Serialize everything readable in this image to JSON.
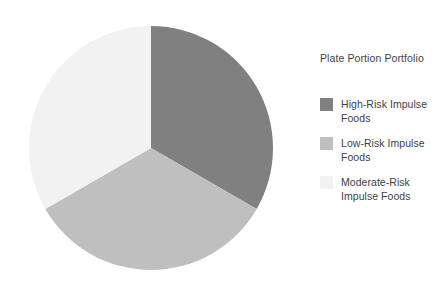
{
  "chart_data": {
    "type": "pie",
    "title": "",
    "legend_title": "Plate Portion Portfolio",
    "legend_position": "right",
    "categories": [
      "High-Risk Impulse Foods",
      "Low-Risk Impulse Foods",
      "Moderate-Risk Impulse Foods"
    ],
    "values": [
      33.3,
      33.3,
      33.3
    ],
    "colors": [
      "#808080",
      "#bfbfbf",
      "#f2f2f2"
    ],
    "start_angle_deg": 0,
    "slice_angles_deg": [
      120,
      120,
      120
    ],
    "center": {
      "x": 151,
      "y": 148
    },
    "radius": 122,
    "xlabel": "",
    "ylabel": "",
    "grid": false,
    "data_labels": false
  },
  "legend": {
    "title": "Plate Portion Portfolio",
    "items": [
      {
        "label": "High-Risk Impulse Foods",
        "color": "#808080"
      },
      {
        "label": "Low-Risk Impulse Foods",
        "color": "#bfbfbf"
      },
      {
        "label": "Moderate-Risk Impulse Foods",
        "color": "#f2f2f2"
      }
    ]
  },
  "theme": {
    "background": "#ffffff",
    "text_color": "#3f3f3f"
  }
}
